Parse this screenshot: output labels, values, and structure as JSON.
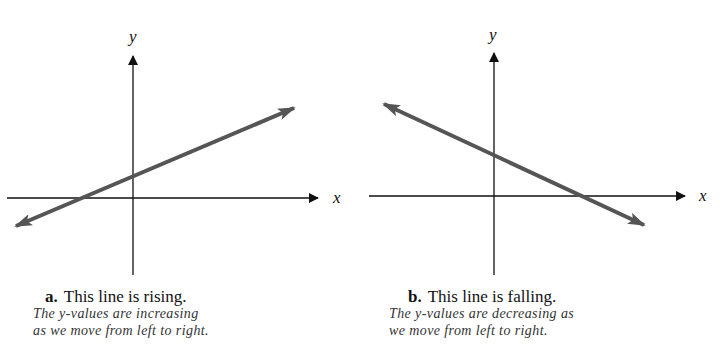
{
  "panels": [
    {
      "id": "a",
      "letter": "a.",
      "title": "This line is rising.",
      "desc_line1": "The y-values are increasing",
      "desc_line2": "as we move from left to right.",
      "x_label": "x",
      "y_label": "y"
    },
    {
      "id": "b",
      "letter": "b.",
      "title": "This line is falling.",
      "desc_line1": "The y-values are decreasing as",
      "desc_line2": "we move from left to right.",
      "x_label": "x",
      "y_label": "y"
    }
  ],
  "colors": {
    "axis": "#111111",
    "line": "#555555"
  }
}
